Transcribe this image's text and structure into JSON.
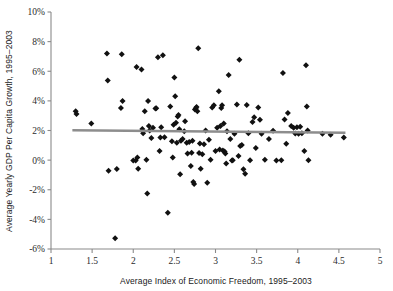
{
  "chart_data": {
    "type": "scatter",
    "title": "",
    "xlabel": "Average Index of Economic Freedom, 1995–2003",
    "ylabel": "Average Yearly GDP Per Capita Growth, 1995–2003",
    "xlim": [
      1,
      5
    ],
    "ylim": [
      -6,
      10
    ],
    "grid": false,
    "legend": null,
    "xticks": [
      1,
      1.5,
      2,
      2.5,
      3,
      3.5,
      4,
      4.5,
      5
    ],
    "xtick_labels": [
      "1",
      "1.5",
      "2",
      "2.5",
      "3",
      "3.5",
      "4",
      "4.5",
      "5"
    ],
    "yticks": [
      -6,
      -4,
      -2,
      0,
      2,
      4,
      6,
      8,
      10
    ],
    "ytick_labels": [
      "-6%",
      "-4%",
      "-2%",
      "0%",
      "2%",
      "4%",
      "6%",
      "8%",
      "10%"
    ],
    "marker": "diamond",
    "marker_color": "#111111",
    "axis_color": "#8a8a8a",
    "points": [
      [
        1.3,
        3.3
      ],
      [
        1.31,
        3.12
      ],
      [
        1.49,
        2.48
      ],
      [
        1.68,
        7.2
      ],
      [
        1.69,
        5.38
      ],
      [
        1.7,
        -0.72
      ],
      [
        1.78,
        -5.28
      ],
      [
        1.8,
        -0.6
      ],
      [
        1.85,
        3.52
      ],
      [
        1.86,
        7.15
      ],
      [
        1.87,
        4.0
      ],
      [
        2.0,
        -0.02
      ],
      [
        2.03,
        -0.02
      ],
      [
        2.04,
        6.28
      ],
      [
        2.05,
        0.18
      ],
      [
        2.06,
        -0.58
      ],
      [
        2.1,
        6.12
      ],
      [
        2.11,
        2.1
      ],
      [
        2.12,
        1.82
      ],
      [
        2.14,
        3.3
      ],
      [
        2.16,
        0.02
      ],
      [
        2.17,
        -2.25
      ],
      [
        2.18,
        4.0
      ],
      [
        2.19,
        2.3
      ],
      [
        2.2,
        2.0
      ],
      [
        2.22,
        1.5
      ],
      [
        2.24,
        2.18
      ],
      [
        2.27,
        3.48
      ],
      [
        2.28,
        3.5
      ],
      [
        2.3,
        6.95
      ],
      [
        2.32,
        0.62
      ],
      [
        2.33,
        1.52
      ],
      [
        2.34,
        2.22
      ],
      [
        2.36,
        7.08
      ],
      [
        2.38,
        1.55
      ],
      [
        2.42,
        -3.55
      ],
      [
        2.45,
        3.62
      ],
      [
        2.47,
        1.28
      ],
      [
        2.48,
        0.18
      ],
      [
        2.49,
        2.38
      ],
      [
        2.5,
        5.58
      ],
      [
        2.51,
        4.32
      ],
      [
        2.52,
        2.52
      ],
      [
        2.53,
        1.18
      ],
      [
        2.54,
        2.95
      ],
      [
        2.55,
        3.05
      ],
      [
        2.56,
        2.08
      ],
      [
        2.57,
        -0.95
      ],
      [
        2.58,
        1.3
      ],
      [
        2.6,
        1.42
      ],
      [
        2.62,
        1.95
      ],
      [
        2.63,
        2.62
      ],
      [
        2.65,
        1.18
      ],
      [
        2.66,
        0.45
      ],
      [
        2.68,
        1.22
      ],
      [
        2.7,
        -0.4
      ],
      [
        2.71,
        0.5
      ],
      [
        2.72,
        1.3
      ],
      [
        2.73,
        -1.48
      ],
      [
        2.74,
        -1.62
      ],
      [
        2.75,
        3.42
      ],
      [
        2.76,
        3.5
      ],
      [
        2.77,
        3.58
      ],
      [
        2.78,
        3.3
      ],
      [
        2.79,
        7.55
      ],
      [
        2.8,
        0.48
      ],
      [
        2.81,
        1.12
      ],
      [
        2.82,
        -0.58
      ],
      [
        2.84,
        0.4
      ],
      [
        2.86,
        1.08
      ],
      [
        2.88,
        2.0
      ],
      [
        2.9,
        -1.52
      ],
      [
        2.92,
        1.38
      ],
      [
        2.94,
        0.02
      ],
      [
        2.96,
        3.55
      ],
      [
        2.98,
        3.7
      ],
      [
        3.0,
        0.62
      ],
      [
        3.02,
        2.18
      ],
      [
        3.04,
        4.65
      ],
      [
        3.05,
        0.72
      ],
      [
        3.06,
        2.3
      ],
      [
        3.07,
        3.52
      ],
      [
        3.08,
        3.7
      ],
      [
        3.09,
        0.65
      ],
      [
        3.1,
        2.48
      ],
      [
        3.11,
        0.58
      ],
      [
        3.12,
        0.45
      ],
      [
        3.13,
        -0.22
      ],
      [
        3.14,
        1.95
      ],
      [
        3.16,
        5.75
      ],
      [
        3.18,
        1.42
      ],
      [
        3.2,
        -0.02
      ],
      [
        3.21,
        0.0
      ],
      [
        3.23,
        1.78
      ],
      [
        3.26,
        3.75
      ],
      [
        3.28,
        0.28
      ],
      [
        3.29,
        6.78
      ],
      [
        3.3,
        0.95
      ],
      [
        3.32,
        1.02
      ],
      [
        3.34,
        -0.62
      ],
      [
        3.36,
        -0.92
      ],
      [
        3.38,
        3.72
      ],
      [
        3.4,
        1.82
      ],
      [
        3.42,
        0.0
      ],
      [
        3.45,
        2.58
      ],
      [
        3.47,
        2.9
      ],
      [
        3.49,
        0.82
      ],
      [
        3.52,
        3.55
      ],
      [
        3.54,
        2.72
      ],
      [
        3.56,
        1.78
      ],
      [
        3.6,
        0.02
      ],
      [
        3.65,
        1.42
      ],
      [
        3.7,
        1.98
      ],
      [
        3.74,
        -0.02
      ],
      [
        3.8,
        0.0
      ],
      [
        3.82,
        5.88
      ],
      [
        3.84,
        2.75
      ],
      [
        3.86,
        1.1
      ],
      [
        3.88,
        3.18
      ],
      [
        3.92,
        2.3
      ],
      [
        3.95,
        2.18
      ],
      [
        3.97,
        1.8
      ],
      [
        3.99,
        2.22
      ],
      [
        4.01,
        1.78
      ],
      [
        4.03,
        2.25
      ],
      [
        4.05,
        1.82
      ],
      [
        4.08,
        0.62
      ],
      [
        4.1,
        6.4
      ],
      [
        4.11,
        3.62
      ],
      [
        4.12,
        2.0
      ],
      [
        4.13,
        0.0
      ],
      [
        4.3,
        1.78
      ],
      [
        4.4,
        1.72
      ],
      [
        4.56,
        1.52
      ]
    ],
    "trend_line": {
      "x_start": 1.26,
      "y_start": 2.02,
      "x_end": 4.58,
      "y_end": 1.85,
      "color": "#8d8d8d"
    }
  }
}
